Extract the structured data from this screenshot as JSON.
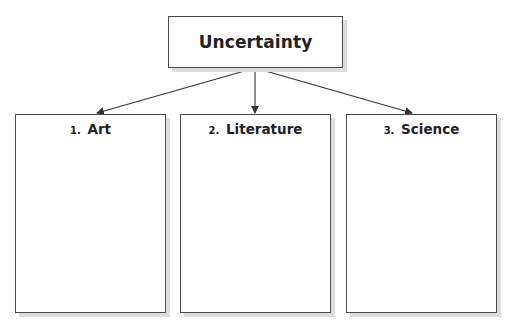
{
  "diagram": {
    "root": {
      "label": "Uncertainty"
    },
    "children": [
      {
        "number": "1.",
        "label": "Art"
      },
      {
        "number": "2.",
        "label": "Literature"
      },
      {
        "number": "3.",
        "label": "Science"
      }
    ],
    "colors": {
      "border": "#4a4a4a",
      "shadow": "#dcdcdc",
      "text": "#222222",
      "background": "#ffffff"
    }
  }
}
